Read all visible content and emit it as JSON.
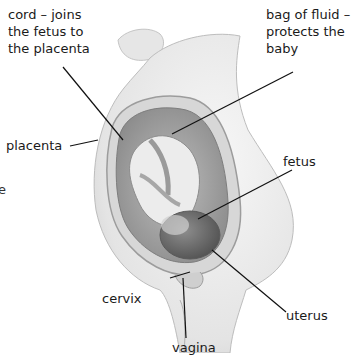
{
  "diagram": {
    "labels": {
      "cord": [
        "cord – joins",
        "the fetus to",
        "the placenta"
      ],
      "bag": [
        "bag of fluid –",
        "protects the",
        "baby"
      ],
      "placenta": "placenta",
      "fetus": "fetus",
      "cervix": "cervix",
      "uterus": "uterus",
      "vagina": "vagina"
    },
    "edge_fragment": "e"
  }
}
